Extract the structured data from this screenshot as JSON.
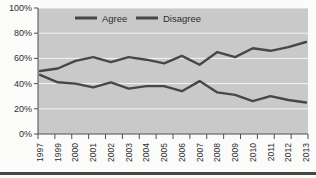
{
  "chart_data": {
    "type": "line",
    "title": "",
    "xlabel": "",
    "ylabel": "",
    "categories": [
      "1997",
      "1999",
      "2000",
      "2001",
      "2002",
      "2003",
      "2004",
      "2005",
      "2006",
      "2007",
      "2008",
      "2009",
      "2010",
      "2011",
      "2012",
      "2013"
    ],
    "series": [
      {
        "name": "Agree",
        "values": [
          50,
          52,
          58,
          61,
          57,
          61,
          59,
          56,
          62,
          55,
          65,
          61,
          68,
          66,
          69,
          73
        ]
      },
      {
        "name": "Disagree",
        "values": [
          47,
          41,
          40,
          37,
          41,
          36,
          38,
          38,
          34,
          42,
          33,
          31,
          26,
          30,
          27,
          25
        ]
      }
    ],
    "ylim": [
      0,
      100
    ],
    "y_tick_labels": [
      "0%",
      "20%",
      "40%",
      "60%",
      "80%",
      "100%"
    ],
    "grid": "horizontal",
    "legend_position": "top-inside",
    "colors": {
      "series_line": "#474747",
      "plot_background": "#c9c9c9",
      "gridline": "#f4f4f4",
      "axis": "#4f4f4f",
      "text": "#2e2e2e",
      "bottom_rule": "#454545",
      "page_background": "#fbfbfa"
    }
  }
}
